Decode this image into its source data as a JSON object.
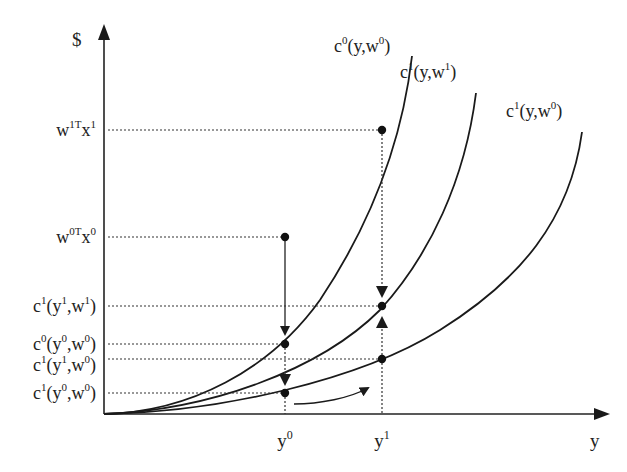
{
  "diagram": {
    "type": "cost-function comparison (economics)",
    "axes": {
      "y_axis_label": "$",
      "x_axis_label": "y"
    },
    "x_ticks": [
      {
        "id": "y0",
        "base": "y",
        "sup": "0"
      },
      {
        "id": "y1",
        "base": "y",
        "sup": "1"
      }
    ],
    "y_labels": [
      {
        "id": "w1Tx1",
        "parts": [
          [
            "w",
            ""
          ],
          [
            "1T",
            "sup"
          ],
          [
            "x",
            ""
          ],
          [
            "1",
            "sup"
          ]
        ]
      },
      {
        "id": "w0Tx0",
        "parts": [
          [
            "w",
            ""
          ],
          [
            "0T",
            "sup"
          ],
          [
            "x",
            ""
          ],
          [
            "0",
            "sup"
          ]
        ]
      },
      {
        "id": "c1y1w1",
        "parts": [
          [
            "c",
            ""
          ],
          [
            "1",
            "sup"
          ],
          [
            "(y",
            ""
          ],
          [
            "1",
            "sup"
          ],
          [
            ",w",
            ""
          ],
          [
            "1",
            "sup"
          ],
          [
            ")",
            ""
          ]
        ]
      },
      {
        "id": "c0y0w0",
        "parts": [
          [
            "c",
            ""
          ],
          [
            "0",
            "sup"
          ],
          [
            "(y",
            ""
          ],
          [
            "0",
            "sup"
          ],
          [
            ",w",
            ""
          ],
          [
            "0",
            "sup"
          ],
          [
            ")",
            ""
          ]
        ]
      },
      {
        "id": "c1y1w0",
        "parts": [
          [
            "c",
            ""
          ],
          [
            "1",
            "sup"
          ],
          [
            "(y",
            ""
          ],
          [
            "1",
            "sup"
          ],
          [
            ",w",
            ""
          ],
          [
            "0",
            "sup"
          ],
          [
            ")",
            ""
          ]
        ]
      },
      {
        "id": "c1y0w0",
        "parts": [
          [
            "c",
            ""
          ],
          [
            "1",
            "sup"
          ],
          [
            "(y",
            ""
          ],
          [
            "0",
            "sup"
          ],
          [
            ",w",
            ""
          ],
          [
            "0",
            "sup"
          ],
          [
            ")",
            ""
          ]
        ]
      }
    ],
    "curves": [
      {
        "id": "c0_y_w0",
        "label_parts": [
          [
            "c",
            ""
          ],
          [
            "0",
            "sup"
          ],
          [
            "(y,w",
            ""
          ],
          [
            "0",
            "sup"
          ],
          [
            ")",
            ""
          ]
        ]
      },
      {
        "id": "c1_y_w1",
        "label_parts": [
          [
            "c",
            ""
          ],
          [
            "1",
            "sup"
          ],
          [
            "(y,w",
            ""
          ],
          [
            "1",
            "sup"
          ],
          [
            ")",
            ""
          ]
        ]
      },
      {
        "id": "c1_y_w0",
        "label_parts": [
          [
            "c",
            ""
          ],
          [
            "1",
            "sup"
          ],
          [
            "(y,w",
            ""
          ],
          [
            "0",
            "sup"
          ],
          [
            ")",
            ""
          ]
        ]
      }
    ],
    "points": [
      {
        "name": "w0Tx0 at y0",
        "x": "y0",
        "level": "w0Tx0"
      },
      {
        "name": "c0(y0,w0)",
        "x": "y0",
        "level": "c0y0w0"
      },
      {
        "name": "c1(y0,w0)",
        "x": "y0",
        "level": "c1y0w0"
      },
      {
        "name": "w1Tx1 at y1",
        "x": "y1",
        "level": "w1Tx1"
      },
      {
        "name": "c1(y1,w1)",
        "x": "y1",
        "level": "c1y1w1"
      },
      {
        "name": "c1(y1,w0)",
        "x": "y1",
        "level": "c1y1w0"
      }
    ],
    "arrows": [
      "w0Tx0 down to c0(y0,w0)",
      "c0(y0,w0) down to c1(y0,w0)",
      "w1Tx1 down to c1(y1,w1)",
      "c1(y1,w0) up to c1(y1,w1)",
      "curved arrow from y0 toward y1 along c1(y,w0)"
    ]
  }
}
